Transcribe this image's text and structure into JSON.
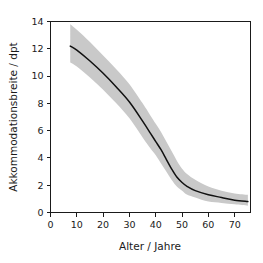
{
  "figure": {
    "background_color": "#ffffff",
    "plot_frame_color": "#1a1a1a",
    "band_color": "#c9c9c9",
    "line_color": "#111111"
  },
  "chart_data": {
    "type": "line",
    "title": "",
    "subtitle": "",
    "xlabel": "Alter / Jahre",
    "ylabel": "Akkommodationsbreite / dpt",
    "xlim": [
      0,
      76
    ],
    "ylim": [
      0,
      14
    ],
    "xticks": [
      0,
      10,
      20,
      30,
      40,
      50,
      60,
      70
    ],
    "xtick_labels": [
      "0",
      "10",
      "20",
      "30",
      "40",
      "50",
      "60",
      "70"
    ],
    "yticks": [
      0,
      2,
      4,
      6,
      8,
      10,
      12,
      14
    ],
    "ytick_labels": [
      "0",
      "2",
      "4",
      "6",
      "8",
      "10",
      "12",
      "14"
    ],
    "grid": false,
    "legend": null,
    "legend_position": "none",
    "annotations": [],
    "x": [
      7.5,
      10,
      15,
      20,
      25,
      30,
      35,
      38,
      40,
      42,
      44,
      46,
      48,
      50,
      52,
      55,
      60,
      65,
      70,
      75
    ],
    "series": [
      {
        "name": "Akkommodationsbreite (Mittelwert)",
        "style": "solid-line",
        "values": [
          12.2,
          11.9,
          11.1,
          10.2,
          9.2,
          8.1,
          6.7,
          5.8,
          5.2,
          4.6,
          3.9,
          3.2,
          2.6,
          2.2,
          1.9,
          1.6,
          1.3,
          1.1,
          0.9,
          0.8
        ]
      },
      {
        "name": "Streubereich obere Grenze",
        "style": "band-upper",
        "values": [
          13.8,
          13.4,
          12.5,
          11.5,
          10.5,
          9.4,
          8.0,
          7.1,
          6.5,
          5.9,
          5.2,
          4.5,
          3.8,
          3.2,
          2.8,
          2.4,
          1.9,
          1.6,
          1.4,
          1.3
        ]
      },
      {
        "name": "Streubereich untere Grenze",
        "style": "band-lower",
        "values": [
          11.0,
          10.7,
          9.9,
          9.0,
          8.0,
          6.9,
          5.5,
          4.7,
          4.2,
          3.6,
          3.0,
          2.4,
          1.9,
          1.6,
          1.3,
          1.1,
          0.8,
          0.7,
          0.6,
          0.5
        ]
      }
    ]
  }
}
